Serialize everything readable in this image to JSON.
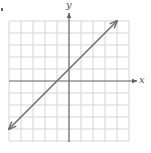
{
  "chart_data": {
    "type": "line",
    "title": "",
    "xlabel": "x",
    "ylabel": "y",
    "xlim": [
      -5,
      5
    ],
    "ylim": [
      -5,
      5
    ],
    "grid": true,
    "grid_step": 1,
    "axes_arrows": {
      "x_positive": true,
      "y_positive": true
    },
    "series": [
      {
        "name": "line",
        "equation": "y = x + 1",
        "x": [
          -5,
          4
        ],
        "y": [
          -4,
          5
        ],
        "arrows_both_ends": true
      }
    ],
    "key_points": {
      "x_intercept": [
        -1,
        0
      ],
      "y_intercept": [
        0,
        1
      ]
    },
    "legend": null
  },
  "colors": {
    "grid": "#d4d4d4",
    "axes": "#606060",
    "line": "#707070",
    "labels": "#555555"
  },
  "labels": {
    "x_axis": "x",
    "y_axis": "y"
  }
}
